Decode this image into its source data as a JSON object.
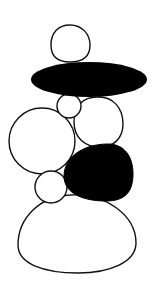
{
  "figure": {
    "width": 164,
    "height": 288,
    "background": "#ffffff",
    "stroke_color": "#111111",
    "fill_dark": "#000000",
    "fill_light": "#ffffff"
  },
  "shapes": [
    {
      "id": "top-stone",
      "type": "circle",
      "cx": 70,
      "cy": 44,
      "r": 19,
      "fill": "light"
    },
    {
      "id": "flat-dark-stone",
      "type": "ellipse",
      "cx": 89,
      "cy": 79.5,
      "rx": 58,
      "ry": 17.5,
      "fill": "dark"
    },
    {
      "id": "small-stone",
      "type": "circle",
      "cx": 69,
      "cy": 106,
      "r": 12,
      "fill": "light"
    },
    {
      "id": "right-middle-stone",
      "type": "ellipse",
      "cx": 99,
      "cy": 122,
      "rx": 24.5,
      "ry": 25,
      "fill": "light"
    },
    {
      "id": "left-large-stone",
      "type": "circle",
      "cx": 42,
      "cy": 141,
      "r": 33,
      "fill": "light"
    },
    {
      "id": "lower-small-stone",
      "type": "circle",
      "cx": 51,
      "cy": 187,
      "r": 16,
      "fill": "light"
    },
    {
      "id": "dark-blob-stone",
      "type": "path",
      "fill": "dark"
    },
    {
      "id": "base-stone",
      "type": "path",
      "fill": "light"
    }
  ]
}
